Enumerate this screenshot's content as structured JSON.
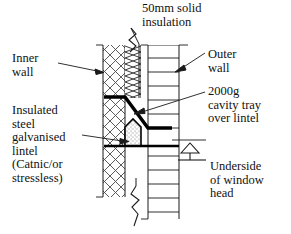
{
  "diagram": {
    "kind": "architectural-section",
    "title": "50mm solid\ninsulation",
    "labels": {
      "inner_wall": "Inner\nwall",
      "lintel": "Insulated\nsteel\ngalvanised\nlintel\n(Catnic/or\nstressless)",
      "outer_wall": "Outer\nwall",
      "cavity_tray": "2000g\ncavity tray\nover lintel",
      "underside": "Underside\nof window\nhead"
    },
    "icons": {
      "level_datum": "level-datum-triangle-icon",
      "break_top": "break-line-icon",
      "break_bottom": "break-line-icon"
    },
    "colors": {
      "background": "#ffffff",
      "line": "#1a1a1a",
      "hatch": "#444444",
      "bold_line": "#000000",
      "stipple": "#8a8a8a"
    }
  }
}
